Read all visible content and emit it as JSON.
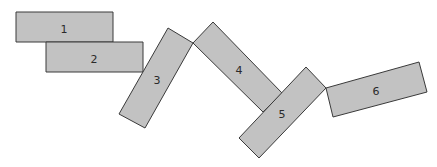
{
  "diagram": {
    "fill_color": "#c2c2c2",
    "stroke_color": "#3a3a3a",
    "blocks": [
      {
        "label": "1",
        "points": "16,12 113,12 113,42 16,42",
        "label_x": 64,
        "label_y": 29
      },
      {
        "label": "2",
        "points": "46,42 143,42 143,72 46,72",
        "label_x": 94,
        "label_y": 59
      },
      {
        "label": "3",
        "points": "168,28 193,43 145,128 119,114",
        "label_x": 157,
        "label_y": 80
      },
      {
        "label": "4",
        "points": "213,22 282,93 263,112 193,43",
        "label_x": 239,
        "label_y": 70
      },
      {
        "label": "5",
        "points": "306,67 326,88 259,158 239,138",
        "label_x": 282,
        "label_y": 114
      },
      {
        "label": "6",
        "points": "326,88 419,62 427,92 333,117",
        "label_x": 376,
        "label_y": 91
      }
    ]
  }
}
